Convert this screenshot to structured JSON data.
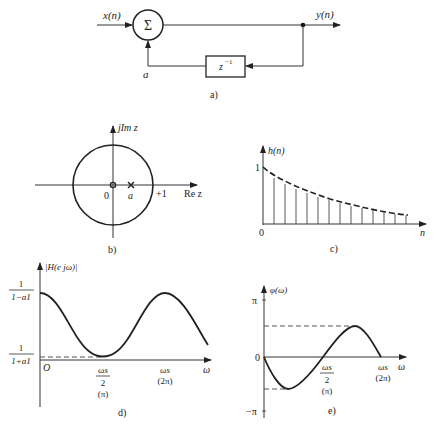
{
  "panel_a": {
    "caption": "a)",
    "input_label": "x(n)",
    "output_label": "y(n)",
    "summer_symbol": "Σ",
    "delay_label": "z",
    "delay_exponent": "−1",
    "feedback_gain": "a"
  },
  "panel_b": {
    "caption": "b)",
    "y_axis_label": "jIm z",
    "x_axis_label": "Re z",
    "origin_label": "0",
    "pole_label": "a",
    "unit_label": "+1"
  },
  "panel_c": {
    "caption": "c)",
    "y_axis_label": "h(n)",
    "x_axis_label": "n",
    "origin_label": "0",
    "y_tick_label": "1"
  },
  "panel_d": {
    "caption": "d)",
    "y_axis_label": "|H(e jω)|",
    "y_max_num": "1",
    "y_max_den": "1−a1",
    "y_min_num": "1",
    "y_min_den": "1+a1",
    "origin_label": "O",
    "x_tick1_num": "ωs",
    "x_tick1_den": "2",
    "x_tick1_alt": "(π)",
    "x_tick2": "ωs",
    "x_tick2_alt": "(2π)",
    "x_axis_label": "ω"
  },
  "panel_e": {
    "caption": "e)",
    "y_axis_label": "φ(ω)",
    "y_top": "π",
    "y_bottom": "−π",
    "origin_label": "0",
    "x_tick1_num": "ωs",
    "x_tick1_den": "2",
    "x_tick1_alt": "(π)",
    "x_tick2": "ωs",
    "x_tick2_alt": "(2π)",
    "x_axis_label": "ω"
  }
}
